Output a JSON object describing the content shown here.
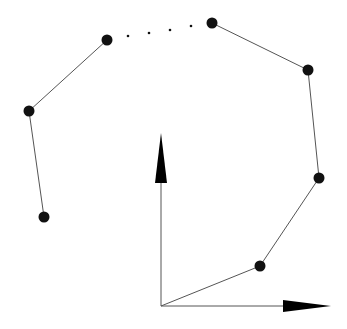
{
  "diagram": {
    "colors": {
      "line": "#555555",
      "point": "#111111",
      "arrow": "#000000",
      "background": "#ffffff"
    },
    "origin": {
      "x": 161,
      "y": 306
    },
    "axes": {
      "vertical": {
        "tip": {
          "x": 161,
          "y": 133
        },
        "head_base_y": 183,
        "head_half_width": 6
      },
      "horizontal": {
        "tip": {
          "x": 331,
          "y": 306
        },
        "head_base_x": 283,
        "head_half_width": 6
      }
    },
    "chain_right": [
      {
        "x": 161,
        "y": 306,
        "dot": false
      },
      {
        "x": 260,
        "y": 266,
        "dot": true
      },
      {
        "x": 319,
        "y": 178,
        "dot": true
      },
      {
        "x": 308,
        "y": 70,
        "dot": true
      },
      {
        "x": 212,
        "y": 23,
        "dot": true
      }
    ],
    "chain_left": [
      {
        "x": 107,
        "y": 40,
        "dot": true
      },
      {
        "x": 29,
        "y": 111,
        "dot": true
      },
      {
        "x": 44,
        "y": 217,
        "dot": true
      }
    ],
    "ellipsis_dots": [
      {
        "x": 128,
        "y": 36
      },
      {
        "x": 149,
        "y": 33
      },
      {
        "x": 170,
        "y": 30
      },
      {
        "x": 191,
        "y": 26
      }
    ],
    "point_radius": 5.5
  }
}
